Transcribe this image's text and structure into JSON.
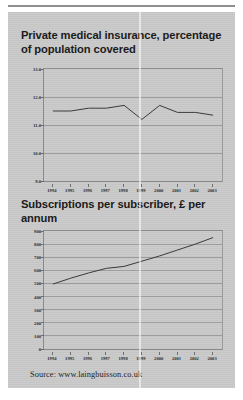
{
  "source_note": "Source: www.laingbuisson.co.uk",
  "charts": [
    {
      "title": "Private medical insurance, percentage of population covered"
    },
    {
      "title": "Subscriptions per subscriber, £ per annum"
    }
  ],
  "chart_data": [
    {
      "type": "line",
      "title": "Private medical insurance, percentage of population covered",
      "xlabel": "",
      "ylabel": "",
      "x": [
        1994,
        1995,
        1996,
        1997,
        1998,
        1999,
        2000,
        2001,
        2002,
        2003
      ],
      "categories": [
        "1994",
        "1995",
        "1996",
        "1997",
        "1998",
        "1999",
        "2000",
        "2001",
        "2002",
        "2003"
      ],
      "values": [
        11.5,
        11.5,
        11.6,
        11.6,
        11.7,
        11.2,
        11.7,
        11.45,
        11.45,
        11.35
      ],
      "ylim": [
        9.0,
        13.0
      ],
      "yticks": [
        "13.0",
        "12.0",
        "11.0",
        "10.0",
        "9.0"
      ],
      "ytick_values": [
        13.0,
        12.0,
        11.0,
        10.0,
        9.0
      ],
      "grid": true,
      "legend": "none"
    },
    {
      "type": "line",
      "title": "Subscriptions per subscriber, £ per annum",
      "xlabel": "",
      "ylabel": "",
      "x": [
        1994,
        1995,
        1996,
        1997,
        1998,
        1999,
        2000,
        2001,
        2002,
        2003
      ],
      "categories": [
        "1994",
        "1995",
        "1996",
        "1997",
        "1998",
        "1999",
        "2000",
        "2001",
        "2002",
        "2003"
      ],
      "values": [
        495,
        540,
        580,
        615,
        630,
        670,
        710,
        755,
        800,
        850
      ],
      "ylim": [
        0,
        900
      ],
      "yticks": [
        "900",
        "800",
        "700",
        "600",
        "500",
        "400",
        "300",
        "200",
        "100",
        "0"
      ],
      "ytick_values": [
        900,
        800,
        700,
        600,
        500,
        400,
        300,
        200,
        100,
        0
      ],
      "grid": true,
      "legend": "none"
    }
  ]
}
